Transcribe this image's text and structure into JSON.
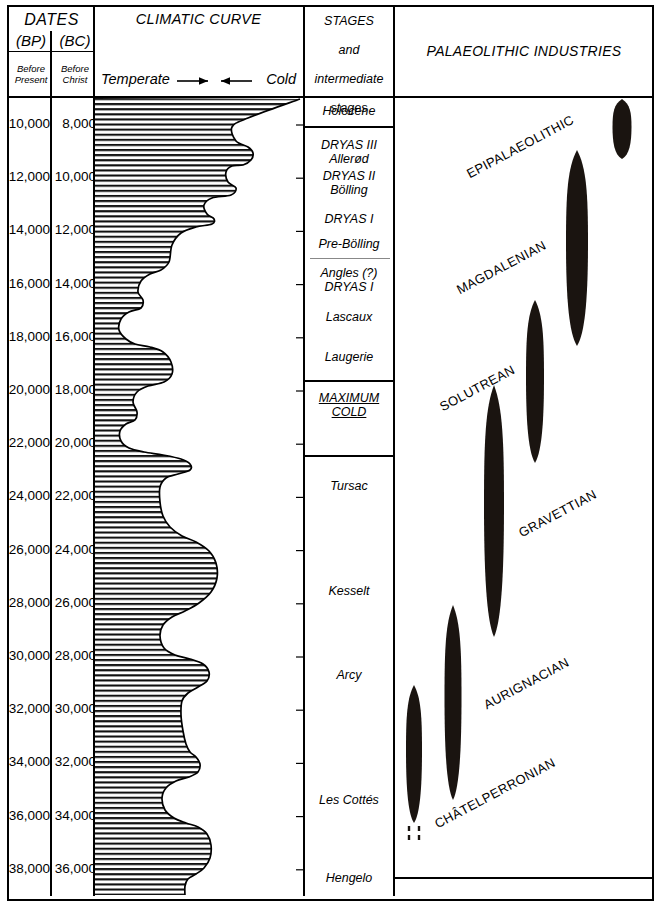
{
  "header": {
    "dates_title": "DATES",
    "bp_label": "(BP)",
    "bc_label": "(BC)",
    "bp_sub": "Before\nPresent",
    "bc_sub": "Before\nChrist",
    "bp_sub_l1": "Before",
    "bp_sub_l2": "Present",
    "bc_sub_l1": "Before",
    "bc_sub_l2": "Christ",
    "climatic_title": "CLIMATIC CURVE",
    "temperate_label": "Temperate",
    "cold_label": "Cold",
    "cold_stages_title_l1": "COLD",
    "cold_stages_title_l2": "STAGES",
    "cold_stages_title_l3": "and",
    "cold_stages_title_l4": "intermediate",
    "cold_stages_title_l5": "stages",
    "industries_title": "PALAEOLITHIC INDUSTRIES"
  },
  "chart_data": {
    "type": "line",
    "xlabel": "Temperate →  ← Cold",
    "ylabel": "Dates BP / BC",
    "ylim": [
      10000,
      38000
    ],
    "grid": false,
    "legend": "none",
    "axes": {
      "bp_ticks": [
        "10,000",
        "12,000",
        "14,000",
        "16,000",
        "18,000",
        "20,000",
        "22,000",
        "24,000",
        "26,000",
        "28,000",
        "30,000",
        "32,000",
        "34,000",
        "36,000",
        "38,000"
      ],
      "bc_ticks": [
        "8,000",
        "10,000",
        "12,000",
        "14,000",
        "16,000",
        "18,000",
        "20,000",
        "22,000",
        "24,000",
        "26,000",
        "28,000",
        "30,000",
        "32,000",
        "34,000",
        "36,000"
      ]
    },
    "cold_stages": [
      {
        "label": "Holocene",
        "y": 112
      },
      {
        "label": "DRYAS III",
        "y": 146
      },
      {
        "label": "Allerød",
        "y": 160
      },
      {
        "label": "DRYAS II",
        "y": 177
      },
      {
        "label": "Bölling",
        "y": 191
      },
      {
        "label": "DRYAS I",
        "y": 220
      },
      {
        "label": "Pre-Bölling",
        "y": 245
      },
      {
        "label": "Angles (?)",
        "y": 274
      },
      {
        "label": "DRYAS I",
        "y": 288
      },
      {
        "label": "Lascaux",
        "y": 318
      },
      {
        "label": "Laugerie",
        "y": 358
      },
      {
        "label": "MAXIMUM",
        "y": 399,
        "underline": true
      },
      {
        "label": "COLD",
        "y": 413,
        "underline": true
      },
      {
        "label": "Tursac",
        "y": 487
      },
      {
        "label": "Kesselt",
        "y": 592
      },
      {
        "label": "Arcy",
        "y": 676
      },
      {
        "label": "Les Cottés",
        "y": 801
      },
      {
        "label": "Hengelo",
        "y": 879
      }
    ],
    "industries": [
      {
        "name": "EPIPALAEOLITHIC",
        "label_x": 464,
        "label_y": 168,
        "angle": -28,
        "spindle_cx": 622,
        "spindle_top": 99,
        "spindle_bottom": 159,
        "spindle_width": 19
      },
      {
        "name": "MAGDALENIAN",
        "label_x": 454,
        "label_y": 284,
        "angle": -28,
        "spindle_cx": 577,
        "spindle_top": 150,
        "spindle_bottom": 346,
        "spindle_width": 22
      },
      {
        "name": "SOLUTREAN",
        "label_x": 437,
        "label_y": 401,
        "angle": -28,
        "spindle_cx": 535,
        "spindle_top": 300,
        "spindle_bottom": 463,
        "spindle_width": 18
      },
      {
        "name": "GRAVETTIAN",
        "label_x": 516,
        "label_y": 527,
        "angle": -28,
        "spindle_cx": 494,
        "spindle_top": 385,
        "spindle_bottom": 637,
        "spindle_width": 20
      },
      {
        "name": "AURIGNACIAN",
        "label_x": 481,
        "label_y": 699,
        "angle": -28,
        "spindle_cx": 453,
        "spindle_top": 605,
        "spindle_bottom": 800,
        "spindle_width": 17
      },
      {
        "name": "CHÂTELPERRONIAN",
        "label_x": 432,
        "label_y": 818,
        "angle": -28,
        "spindle_cx": 414,
        "spindle_top": 685,
        "spindle_bottom": 823,
        "spindle_width": 16,
        "dashed_tail": true
      }
    ],
    "curve_description": "Oscillating palaeo-temperature curve, hatched on the cold (left) side, warm excursions to the right",
    "curve_points": [
      [
        300,
        99
      ],
      [
        248,
        118
      ],
      [
        232,
        127
      ],
      [
        236,
        141
      ],
      [
        248,
        147
      ],
      [
        253,
        153
      ],
      [
        251,
        160
      ],
      [
        243,
        165
      ],
      [
        232,
        166
      ],
      [
        226,
        172
      ],
      [
        228,
        182
      ],
      [
        236,
        188
      ],
      [
        231,
        195
      ],
      [
        212,
        198
      ],
      [
        204,
        205
      ],
      [
        207,
        214
      ],
      [
        214,
        219
      ],
      [
        212,
        224
      ],
      [
        196,
        227
      ],
      [
        181,
        233
      ],
      [
        172,
        245
      ],
      [
        169,
        262
      ],
      [
        161,
        270
      ],
      [
        150,
        274
      ],
      [
        141,
        281
      ],
      [
        138,
        292
      ],
      [
        143,
        300
      ],
      [
        141,
        308
      ],
      [
        129,
        312
      ],
      [
        121,
        319
      ],
      [
        119,
        330
      ],
      [
        126,
        339
      ],
      [
        135,
        344
      ],
      [
        150,
        347
      ],
      [
        163,
        352
      ],
      [
        171,
        362
      ],
      [
        172,
        374
      ],
      [
        164,
        382
      ],
      [
        148,
        386
      ],
      [
        137,
        392
      ],
      [
        133,
        402
      ],
      [
        137,
        412
      ],
      [
        135,
        420
      ],
      [
        126,
        424
      ],
      [
        120,
        431
      ],
      [
        121,
        441
      ],
      [
        129,
        448
      ],
      [
        144,
        452
      ],
      [
        163,
        455
      ],
      [
        181,
        459
      ],
      [
        190,
        464
      ],
      [
        190,
        470
      ],
      [
        178,
        474
      ],
      [
        166,
        478
      ],
      [
        160,
        487
      ],
      [
        160,
        502
      ],
      [
        163,
        516
      ],
      [
        170,
        527
      ],
      [
        182,
        536
      ],
      [
        196,
        542
      ],
      [
        209,
        551
      ],
      [
        216,
        563
      ],
      [
        217,
        578
      ],
      [
        211,
        592
      ],
      [
        199,
        603
      ],
      [
        185,
        611
      ],
      [
        172,
        617
      ],
      [
        163,
        625
      ],
      [
        160,
        636
      ],
      [
        164,
        648
      ],
      [
        175,
        655
      ],
      [
        190,
        659
      ],
      [
        203,
        664
      ],
      [
        209,
        672
      ],
      [
        207,
        681
      ],
      [
        198,
        687
      ],
      [
        188,
        693
      ],
      [
        182,
        701
      ],
      [
        181,
        715
      ],
      [
        183,
        731
      ],
      [
        186,
        744
      ],
      [
        190,
        752
      ],
      [
        196,
        757
      ],
      [
        200,
        764
      ],
      [
        198,
        772
      ],
      [
        189,
        777
      ],
      [
        176,
        781
      ],
      [
        166,
        788
      ],
      [
        162,
        798
      ],
      [
        165,
        810
      ],
      [
        174,
        818
      ],
      [
        186,
        823
      ],
      [
        198,
        827
      ],
      [
        207,
        834
      ],
      [
        211,
        845
      ],
      [
        210,
        858
      ],
      [
        204,
        868
      ],
      [
        196,
        874
      ],
      [
        188,
        879
      ],
      [
        185,
        886
      ],
      [
        185,
        896
      ]
    ]
  }
}
